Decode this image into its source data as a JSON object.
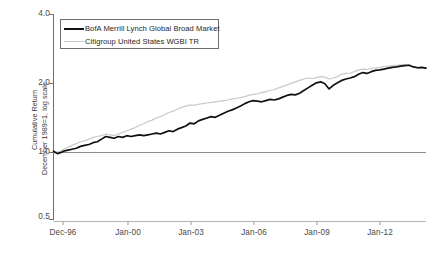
{
  "chart_data": {
    "type": "line",
    "title": "",
    "xlabel": "",
    "ylabel_line1": "Cumulative Return",
    "ylabel_line2": "December 1989=1, log scale",
    "yscale": "log",
    "ylim": [
      0.5,
      4.0
    ],
    "ytick_labels": [
      "4.0",
      "2.0",
      "1.0",
      "0.5"
    ],
    "ytick_values": [
      4.0,
      2.0,
      1.0,
      0.5
    ],
    "xtick_labels": [
      "Dec-96",
      "Jan-00",
      "Jan-03",
      "Jan-06",
      "Jan-09",
      "Jan-12"
    ],
    "xtick_values": [
      1996.92,
      2000.0,
      2003.0,
      2006.0,
      2009.0,
      2012.0
    ],
    "xlim": [
      1996.92,
      2014.6
    ],
    "grid": false,
    "reference_line": 1.0,
    "legend_position": "top-left",
    "series": [
      {
        "name": "BofA Merrill Lynch Global Broad Market",
        "color": "#111111",
        "width": 1.7,
        "x": [
          1996.92,
          1997.1,
          1997.25,
          1997.4,
          1997.6,
          1997.8,
          1998.0,
          1998.2,
          1998.4,
          1998.6,
          1998.8,
          1999.0,
          1999.2,
          1999.4,
          1999.6,
          1999.8,
          2000.0,
          2000.2,
          2000.4,
          2000.6,
          2000.8,
          2001.0,
          2001.2,
          2001.4,
          2001.6,
          2001.8,
          2002.0,
          2002.2,
          2002.4,
          2002.6,
          2002.8,
          2003.0,
          2003.2,
          2003.4,
          2003.6,
          2003.8,
          2004.0,
          2004.2,
          2004.4,
          2004.6,
          2004.8,
          2005.0,
          2005.2,
          2005.4,
          2005.6,
          2005.8,
          2006.0,
          2006.2,
          2006.4,
          2006.6,
          2006.8,
          2007.0,
          2007.2,
          2007.4,
          2007.6,
          2007.8,
          2008.0,
          2008.2,
          2008.4,
          2008.6,
          2008.8,
          2009.0,
          2009.2,
          2009.4,
          2009.6,
          2009.8,
          2010.0,
          2010.2,
          2010.4,
          2010.6,
          2010.8,
          2011.0,
          2011.2,
          2011.4,
          2011.6,
          2011.8,
          2012.0,
          2012.2,
          2012.4,
          2012.6,
          2012.8,
          2013.0,
          2013.2,
          2013.4,
          2013.6,
          2013.8,
          2014.0,
          2014.2,
          2014.4,
          2014.6
        ],
        "y": [
          1.0,
          0.975,
          0.985,
          1.0,
          1.01,
          1.02,
          1.03,
          1.05,
          1.06,
          1.07,
          1.09,
          1.1,
          1.13,
          1.16,
          1.15,
          1.14,
          1.16,
          1.15,
          1.17,
          1.16,
          1.17,
          1.18,
          1.17,
          1.18,
          1.19,
          1.2,
          1.19,
          1.21,
          1.23,
          1.22,
          1.25,
          1.27,
          1.29,
          1.33,
          1.32,
          1.36,
          1.38,
          1.4,
          1.42,
          1.41,
          1.44,
          1.47,
          1.5,
          1.52,
          1.55,
          1.58,
          1.62,
          1.65,
          1.67,
          1.66,
          1.65,
          1.67,
          1.69,
          1.68,
          1.7,
          1.73,
          1.76,
          1.78,
          1.77,
          1.8,
          1.85,
          1.9,
          1.95,
          2.0,
          2.02,
          1.98,
          1.88,
          1.95,
          2.0,
          2.05,
          2.08,
          2.1,
          2.13,
          2.18,
          2.22,
          2.2,
          2.24,
          2.27,
          2.28,
          2.3,
          2.32,
          2.34,
          2.35,
          2.37,
          2.38,
          2.39,
          2.35,
          2.33,
          2.34,
          2.32
        ]
      },
      {
        "name": "Citigroup United States WGBI TR",
        "color": "#c9c9c9",
        "width": 1.2,
        "x": [
          1996.92,
          1997.1,
          1997.25,
          1997.4,
          1997.6,
          1997.8,
          1998.0,
          1998.2,
          1998.4,
          1998.6,
          1998.8,
          1999.0,
          1999.2,
          1999.4,
          1999.6,
          1999.8,
          2000.0,
          2000.2,
          2000.4,
          2000.6,
          2000.8,
          2001.0,
          2001.2,
          2001.4,
          2001.6,
          2001.8,
          2002.0,
          2002.2,
          2002.4,
          2002.6,
          2002.8,
          2003.0,
          2003.2,
          2003.4,
          2003.6,
          2003.8,
          2004.0,
          2004.2,
          2004.4,
          2004.6,
          2004.8,
          2005.0,
          2005.2,
          2005.4,
          2005.6,
          2005.8,
          2006.0,
          2006.2,
          2006.4,
          2006.6,
          2006.8,
          2007.0,
          2007.2,
          2007.4,
          2007.6,
          2007.8,
          2008.0,
          2008.2,
          2008.4,
          2008.6,
          2008.8,
          2009.0,
          2009.2,
          2009.4,
          2009.6,
          2009.8,
          2010.0,
          2010.2,
          2010.4,
          2010.6,
          2010.8,
          2011.0,
          2011.2,
          2011.4,
          2011.6,
          2011.8,
          2012.0,
          2012.2,
          2012.4,
          2012.6,
          2012.8,
          2013.0,
          2013.2,
          2013.4,
          2013.6,
          2013.8,
          2014.0,
          2014.2,
          2014.4,
          2014.6
        ],
        "y": [
          1.0,
          0.99,
          1.0,
          1.02,
          1.04,
          1.06,
          1.08,
          1.1,
          1.11,
          1.13,
          1.15,
          1.16,
          1.17,
          1.19,
          1.18,
          1.17,
          1.19,
          1.21,
          1.23,
          1.25,
          1.27,
          1.3,
          1.32,
          1.35,
          1.37,
          1.4,
          1.42,
          1.45,
          1.48,
          1.5,
          1.53,
          1.56,
          1.58,
          1.6,
          1.59,
          1.61,
          1.62,
          1.63,
          1.64,
          1.65,
          1.66,
          1.67,
          1.68,
          1.7,
          1.71,
          1.72,
          1.74,
          1.76,
          1.78,
          1.79,
          1.81,
          1.83,
          1.85,
          1.87,
          1.9,
          1.93,
          1.96,
          1.99,
          2.02,
          2.05,
          2.08,
          2.1,
          2.09,
          2.11,
          2.13,
          2.12,
          2.08,
          2.1,
          2.13,
          2.18,
          2.2,
          2.21,
          2.24,
          2.28,
          2.3,
          2.29,
          2.31,
          2.33,
          2.34,
          2.36,
          2.37,
          2.38,
          2.39,
          2.4,
          2.41,
          2.4,
          2.36,
          2.34,
          2.33,
          2.31
        ]
      }
    ]
  },
  "legend": {
    "items": [
      {
        "label": "BofA Merrill Lynch Global Broad Market",
        "style": "black"
      },
      {
        "label": "Citigroup United States WGBI TR",
        "style": "gray"
      }
    ]
  },
  "footnote": {
    "text": ""
  }
}
